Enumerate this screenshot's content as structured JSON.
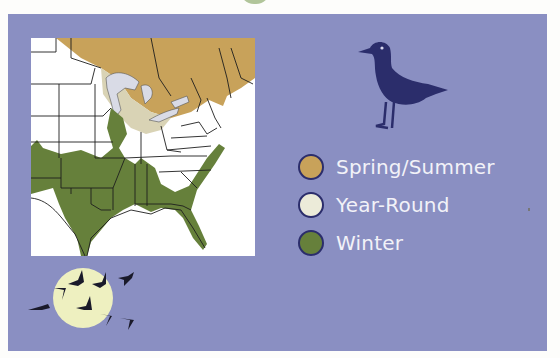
{
  "legend": {
    "items": [
      {
        "label": "Spring/Summer",
        "color": "#c8a25a"
      },
      {
        "label": "Year-Round",
        "color": "#ecebd9"
      },
      {
        "label": "Winter",
        "color": "#66803b"
      }
    ]
  },
  "colors": {
    "panel": "#8a8fc2",
    "bird": "#2b2d6b",
    "moon": "#eef0c0",
    "map_border": "#1e1e1e",
    "water": "#ffffff",
    "lakes": "#d9dbe6"
  },
  "icons": {
    "standing_bird": "standing-bird-icon",
    "flying_flock": "flying-geese-icon",
    "moon": "moon-icon"
  }
}
